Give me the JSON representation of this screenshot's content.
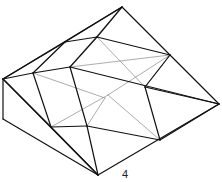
{
  "figure": {
    "label": "4",
    "stroke_color": "#111111",
    "thin_color": "#888888",
    "vertices": {
      "top": [
        122,
        7
      ],
      "left": [
        3,
        79
      ],
      "leftBottom": [
        3,
        119
      ],
      "right": [
        219,
        104
      ],
      "bottom": [
        98,
        175
      ],
      "rmid": [
        170,
        55
      ],
      "r2": [
        160,
        140
      ],
      "ul1": [
        65,
        42
      ],
      "ul2": [
        97,
        37
      ],
      "m1": [
        33,
        73
      ],
      "m2": [
        70,
        67
      ],
      "c1": [
        145,
        87
      ],
      "b1": [
        51,
        127
      ],
      "b2": [
        87,
        126
      ],
      "s1": [
        105,
        98
      ],
      "s2": [
        108,
        95
      ]
    },
    "edges_thick": [
      [
        "top",
        "left"
      ],
      [
        "top",
        "right"
      ],
      [
        "left",
        "leftBottom"
      ],
      [
        "leftBottom",
        "bottom"
      ],
      [
        "bottom",
        "right"
      ],
      [
        "left",
        "bottom"
      ],
      [
        "left",
        "m1"
      ],
      [
        "m1",
        "m2"
      ],
      [
        "m2",
        "right"
      ],
      [
        "left",
        "ul1"
      ],
      [
        "ul1",
        "ul2"
      ],
      [
        "ul2",
        "rmid"
      ],
      [
        "ul2",
        "top"
      ],
      [
        "ul1",
        "top"
      ],
      [
        "m2",
        "ul2"
      ],
      [
        "m1",
        "ul1"
      ],
      [
        "m2",
        "b2"
      ],
      [
        "b2",
        "bottom"
      ],
      [
        "m1",
        "b1"
      ],
      [
        "b1",
        "b2"
      ],
      [
        "b2",
        "r2"
      ],
      [
        "r2",
        "c1"
      ],
      [
        "c1",
        "rmid"
      ],
      [
        "c1",
        "right"
      ],
      [
        "b1",
        "bottom"
      ],
      [
        "left",
        "b1"
      ],
      [
        "r2",
        "right"
      ]
    ],
    "edges_thin": [
      [
        "ul2",
        "c1"
      ],
      [
        "rmid",
        "c1"
      ],
      [
        "b1",
        "s2"
      ],
      [
        "s2",
        "r2"
      ],
      [
        "m1",
        "s1"
      ],
      [
        "rmid",
        "m2"
      ],
      [
        "top",
        "m2"
      ],
      [
        "ul1",
        "m1"
      ],
      [
        "b2",
        "s1"
      ],
      [
        "rmid",
        "s2"
      ]
    ]
  }
}
